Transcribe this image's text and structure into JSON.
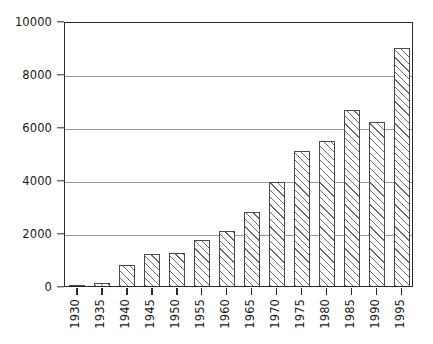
{
  "chart_data": {
    "type": "bar",
    "title": "",
    "subtitle": "",
    "xlabel": "",
    "ylabel": "",
    "categories": [
      "1930",
      "1935",
      "1940",
      "1945",
      "1950",
      "1955",
      "1960",
      "1965",
      "1970",
      "1975",
      "1980",
      "1985",
      "1990",
      "1995"
    ],
    "values": [
      30,
      130,
      780,
      1200,
      1250,
      1730,
      2060,
      2810,
      3920,
      5080,
      5470,
      6650,
      6190,
      9000
    ],
    "series": [
      {
        "name": "",
        "values": [
          30,
          130,
          780,
          1200,
          1250,
          1730,
          2060,
          2810,
          3920,
          5080,
          5470,
          6650,
          6190,
          9000
        ]
      }
    ],
    "ylim": [
      0,
      10000
    ],
    "y_ticks": [
      0,
      2000,
      4000,
      6000,
      8000,
      10000
    ],
    "y_tick_labels": [
      "0",
      "2000",
      "4000",
      "6000",
      "8000",
      "10000"
    ],
    "x_tick_labels": [
      "1930",
      "1935",
      "1940",
      "1945",
      "1950",
      "1955",
      "1960",
      "1965",
      "1970",
      "1975",
      "1980",
      "1985",
      "1990",
      "1995"
    ],
    "grid": true,
    "grid_axis": "y",
    "legend": false,
    "legend_position": "none",
    "bar_fill": "hatch-diagonal",
    "bar_edge_color": "#4a4a4a",
    "bar_face_color": "#ffffff",
    "hatch_color": "#3c3c3c",
    "grid_color": "#9a9a9a",
    "axis_color": "#2b2b2b",
    "background_color": "#ffffff",
    "x_tick_label_rotation": 90,
    "annotations": []
  }
}
